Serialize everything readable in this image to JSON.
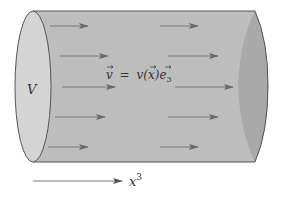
{
  "diagram": {
    "volume_label": "V",
    "velocity_label": "v⃗ = v(x⃗)e⃗₃",
    "velocity_parts": {
      "lhs": "v",
      "equals": "=",
      "fn": "v(",
      "arg": "x",
      "close": ")",
      "basis": "e",
      "sub": "3"
    },
    "axis_label_base": "x",
    "axis_label_sup": "3",
    "colors": {
      "cylinder_body": "#bdbdbd",
      "left_face": "#d4d4d4",
      "right_face": "#a9a9a9",
      "outline": "#555555",
      "arrow": "#6a6a6a"
    },
    "flow_arrows": [
      {
        "x1": 50,
        "x2": 88,
        "y": 26
      },
      {
        "x1": 60,
        "x2": 108,
        "y": 56
      },
      {
        "x1": 62,
        "x2": 115,
        "y": 87
      },
      {
        "x1": 55,
        "x2": 105,
        "y": 117
      },
      {
        "x1": 48,
        "x2": 88,
        "y": 147
      },
      {
        "x1": 160,
        "x2": 198,
        "y": 26
      },
      {
        "x1": 168,
        "x2": 218,
        "y": 56
      },
      {
        "x1": 175,
        "x2": 233,
        "y": 87
      },
      {
        "x1": 168,
        "x2": 218,
        "y": 117
      },
      {
        "x1": 160,
        "x2": 198,
        "y": 147
      }
    ]
  }
}
